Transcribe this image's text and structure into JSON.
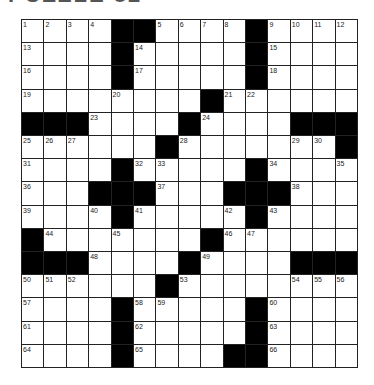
{
  "puzzle": {
    "title_fragment": "PUZZLE 82",
    "rows": 15,
    "cols": 15,
    "grid": [
      "....##....#....",
      "....#.....#....",
      "....#.....#....",
      "........#......",
      "###....#....###",
      "......#.......#",
      "....#.....#....",
      "...###...###...",
      "....#.....#....",
      "#.......#......",
      "###....#....###",
      "......#........",
      "....#.....#....",
      "....#.....#....",
      "....#....##...."
    ],
    "numbers": [
      [
        1,
        2,
        3,
        4,
        0,
        0,
        5,
        6,
        7,
        8,
        0,
        9,
        10,
        11,
        12
      ],
      [
        13,
        0,
        0,
        0,
        0,
        14,
        0,
        0,
        0,
        0,
        0,
        15,
        0,
        0,
        0
      ],
      [
        16,
        0,
        0,
        0,
        0,
        17,
        0,
        0,
        0,
        0,
        0,
        18,
        0,
        0,
        0
      ],
      [
        19,
        0,
        0,
        0,
        20,
        0,
        0,
        0,
        0,
        21,
        22,
        0,
        0,
        0,
        0
      ],
      [
        0,
        0,
        0,
        23,
        0,
        0,
        0,
        0,
        24,
        0,
        0,
        0,
        0,
        0,
        0
      ],
      [
        25,
        26,
        27,
        0,
        0,
        0,
        0,
        28,
        0,
        0,
        0,
        0,
        29,
        30,
        0
      ],
      [
        31,
        0,
        0,
        0,
        0,
        32,
        33,
        0,
        0,
        0,
        0,
        34,
        0,
        0,
        35
      ],
      [
        36,
        0,
        0,
        0,
        0,
        0,
        37,
        0,
        0,
        0,
        0,
        0,
        38,
        0,
        0
      ],
      [
        39,
        0,
        0,
        40,
        0,
        41,
        0,
        0,
        0,
        42,
        0,
        43,
        0,
        0,
        0
      ],
      [
        0,
        44,
        0,
        0,
        45,
        0,
        0,
        0,
        0,
        46,
        47,
        0,
        0,
        0,
        0
      ],
      [
        0,
        0,
        0,
        48,
        0,
        0,
        0,
        0,
        49,
        0,
        0,
        0,
        0,
        0,
        0
      ],
      [
        50,
        51,
        52,
        0,
        0,
        0,
        0,
        53,
        0,
        0,
        0,
        0,
        54,
        55,
        56
      ],
      [
        57,
        0,
        0,
        0,
        0,
        58,
        59,
        0,
        0,
        0,
        0,
        60,
        0,
        0,
        0
      ],
      [
        61,
        0,
        0,
        0,
        0,
        62,
        0,
        0,
        0,
        0,
        0,
        63,
        0,
        0,
        0
      ],
      [
        64,
        0,
        0,
        0,
        0,
        65,
        0,
        0,
        0,
        0,
        0,
        66,
        0,
        0,
        0
      ]
    ]
  }
}
